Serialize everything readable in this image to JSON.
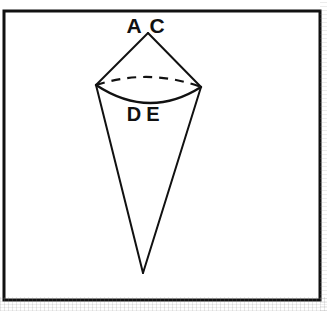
{
  "figure": {
    "kind": "geometry-diagram",
    "background_color": "#ffffff",
    "ink_color": "#111111",
    "frame": {
      "name": "outer-rectangle-border",
      "x": 4,
      "y": 11,
      "width": 316,
      "height": 289,
      "stroke_width": 3,
      "color": "#111111"
    },
    "labels": [
      {
        "id": "A",
        "text": "A",
        "x": 134,
        "y": 33
      },
      {
        "id": "C",
        "text": "C",
        "x": 157,
        "y": 33
      },
      {
        "id": "D",
        "text": "D",
        "x": 134,
        "y": 121
      },
      {
        "id": "E",
        "text": "E",
        "x": 153,
        "y": 121
      }
    ],
    "points": {
      "apex_top": {
        "x": 148,
        "y": 33
      },
      "rim_left": {
        "x": 96,
        "y": 85
      },
      "rim_right": {
        "x": 201,
        "y": 87
      },
      "apex_bottom": {
        "x": 143,
        "y": 273
      },
      "rim_front_low": {
        "x": 149,
        "y": 103
      },
      "rim_back_high": {
        "x": 149,
        "y": 77
      }
    },
    "strokes": [
      {
        "name": "upper-cone-left-edge",
        "style": "solid",
        "width": 2
      },
      {
        "name": "upper-cone-right-edge",
        "style": "solid",
        "width": 2
      },
      {
        "name": "lower-cone-left-edge",
        "style": "solid",
        "width": 2
      },
      {
        "name": "lower-cone-right-edge",
        "style": "solid",
        "width": 2
      },
      {
        "name": "base-ellipse-front-arc",
        "style": "solid",
        "width": 2.4
      },
      {
        "name": "base-ellipse-back-arc",
        "style": "dashed",
        "width": 2.2,
        "dash": "9 7"
      }
    ]
  }
}
